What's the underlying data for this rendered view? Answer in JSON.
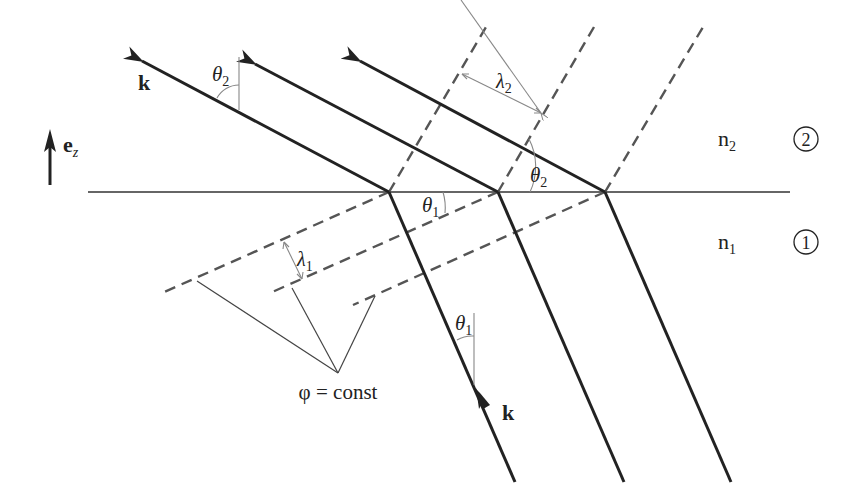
{
  "diagram": {
    "labels": {
      "k_upper": "k",
      "k_lower": "k",
      "unit_vector": "e",
      "unit_vector_sub": "z",
      "theta2_top": "θ",
      "theta2_top_sub": "2",
      "theta2_interface": "θ",
      "theta2_interface_sub": "2",
      "theta1_interface": "θ",
      "theta1_interface_sub": "1",
      "theta1_lower": "θ",
      "theta1_lower_sub": "1",
      "lambda2": "λ",
      "lambda2_sub": "2",
      "lambda1": "λ",
      "lambda1_sub": "1",
      "n2": "n",
      "n2_sub": "2",
      "n1": "n",
      "n1_sub": "1",
      "medium2_marker": "2",
      "medium1_marker": "1",
      "phase_front": "φ = const"
    },
    "media": [
      {
        "id": 2,
        "index_label": "n2",
        "position": "above interface",
        "wavelength": "λ2",
        "angle": "θ2"
      },
      {
        "id": 1,
        "index_label": "n1",
        "position": "below interface",
        "wavelength": "λ1",
        "angle": "θ1"
      }
    ],
    "geometry": {
      "interface": {
        "x1": 88,
        "y1": 192,
        "x2": 790,
        "y2": 192
      },
      "refraction_points": [
        [
          389,
          192
        ],
        [
          498,
          192
        ],
        [
          605,
          192
        ]
      ],
      "rays_medium2_arrow_tips": [
        [
          137,
          58
        ],
        [
          250,
          61
        ],
        [
          355,
          58
        ]
      ],
      "rays_medium1_bottoms": [
        [
          515,
          482
        ],
        [
          624,
          482
        ],
        [
          731,
          482
        ]
      ],
      "wavefronts_medium2_tops": [
        [
          486,
          27
        ],
        [
          594,
          27
        ],
        [
          703,
          27
        ]
      ],
      "wavefronts_medium1_ends": [
        [
          162,
          293
        ],
        [
          270,
          293
        ],
        [
          353,
          305
        ]
      ],
      "phase_point": [
        338,
        373
      ],
      "phase_leader_tips": [
        [
          197,
          281
        ],
        [
          292,
          288
        ],
        [
          375,
          296
        ]
      ]
    },
    "colors": {
      "ray": "#222222",
      "wavefront": "#555555",
      "guide": "#888888",
      "background": "#ffffff"
    }
  }
}
